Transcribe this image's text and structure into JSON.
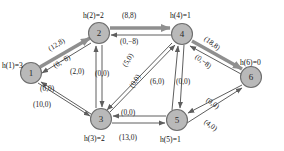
{
  "figure": {
    "type": "network-flow-graph",
    "background": "#ffffff",
    "node_fill": "#b9b9b9",
    "node_stroke": "#6e6e6e",
    "edge_color": "#5e5e5e",
    "bold_edge_color": "#8a8a8a",
    "text_color": "#1a1a1a"
  },
  "nodes": [
    {
      "id": "1",
      "label": "1",
      "x": 31,
      "y": 73,
      "r": 10.5,
      "height_label": "h(1)=3"
    },
    {
      "id": "2",
      "label": "2",
      "x": 99,
      "y": 33,
      "r": 10.5,
      "height_label": "h(2)=2"
    },
    {
      "id": "3",
      "label": "3",
      "x": 101,
      "y": 119,
      "r": 10.5,
      "height_label": "h(3)=2"
    },
    {
      "id": "4",
      "label": "4",
      "x": 182,
      "y": 34,
      "r": 10.5,
      "height_label": "h(4)=1"
    },
    {
      "id": "5",
      "label": "5",
      "x": 177,
      "y": 120,
      "r": 10.5,
      "height_label": "h(5)=1"
    },
    {
      "id": "6",
      "label": "6",
      "x": 251,
      "y": 77,
      "r": 10.5,
      "height_label": "h(6)=0"
    }
  ],
  "height_labels": [
    {
      "node": "1",
      "text": "h(1)=3",
      "x": 2,
      "y": 62
    },
    {
      "node": "2",
      "text": "h(2)=2",
      "x": 83,
      "y": 12
    },
    {
      "node": "3",
      "text": "h(3)=2",
      "x": 84,
      "y": 135
    },
    {
      "node": "4",
      "text": "h(4)=1",
      "x": 170,
      "y": 12
    },
    {
      "node": "5",
      "text": "h(5)=1",
      "x": 160,
      "y": 136
    },
    {
      "node": "6",
      "text": "h(6)=0",
      "x": 240,
      "y": 59
    }
  ],
  "edges": [
    {
      "from": "1",
      "to": "2",
      "label": "(12,8)",
      "bold": true,
      "lx": 47,
      "ly": 46,
      "rot": -31
    },
    {
      "from": "2",
      "to": "1",
      "label": "(0,−8)",
      "bold": false,
      "lx": 52,
      "ly": 63,
      "rot": -31
    },
    {
      "from": "2",
      "to": "4",
      "label": "(8,8)",
      "bold": true,
      "lx": 122,
      "ly": 12,
      "rot": 0
    },
    {
      "from": "4",
      "to": "2",
      "label": "(0,−8)",
      "bold": false,
      "lx": 120,
      "ly": 38,
      "rot": 0
    },
    {
      "from": "4",
      "to": "6",
      "label": "(18,8)",
      "bold": true,
      "lx": 207,
      "ly": 35,
      "rot": 36
    },
    {
      "from": "6",
      "to": "4",
      "label": "(0,−8)",
      "bold": false,
      "lx": 198,
      "ly": 53,
      "rot": 36
    },
    {
      "from": "3",
      "to": "2",
      "label": "(2,0)",
      "bold": false,
      "lx": 70,
      "ly": 68,
      "rot": 0
    },
    {
      "from": "2",
      "to": "3",
      "label": "(0,0)",
      "bold": false,
      "lx": 95,
      "ly": 70,
      "rot": 0
    },
    {
      "from": "3",
      "to": "1",
      "label": "(0,0)",
      "bold": false,
      "lx": 40,
      "ly": 85,
      "rot": 0
    },
    {
      "from": "1",
      "to": "3",
      "label": "(10,0)",
      "bold": false,
      "lx": 33,
      "ly": 101,
      "rot": 0
    },
    {
      "from": "3",
      "to": "4",
      "label": "(5,0)",
      "bold": false,
      "lx": 121,
      "ly": 64,
      "rot": -58
    },
    {
      "from": "4",
      "to": "3",
      "label": "(0,0)",
      "bold": false,
      "lx": 128,
      "ly": 85,
      "rot": -58
    },
    {
      "from": "5",
      "to": "4",
      "label": "(6,0)",
      "bold": false,
      "lx": 150,
      "ly": 78,
      "rot": 0
    },
    {
      "from": "4",
      "to": "5",
      "label": "(0,0)",
      "bold": false,
      "lx": 176,
      "ly": 78,
      "rot": 0
    },
    {
      "from": "5",
      "to": "3",
      "label": "(0,0)",
      "bold": false,
      "lx": 121,
      "ly": 109,
      "rot": 0
    },
    {
      "from": "3",
      "to": "5",
      "label": "(13,0)",
      "bold": false,
      "lx": 119,
      "ly": 134,
      "rot": 0
    },
    {
      "from": "6",
      "to": "5",
      "label": "(0,0)",
      "bold": false,
      "lx": 209,
      "ly": 96,
      "rot": 35
    },
    {
      "from": "5",
      "to": "6",
      "label": "(4,0)",
      "bold": false,
      "lx": 207,
      "ly": 118,
      "rot": 35
    }
  ]
}
